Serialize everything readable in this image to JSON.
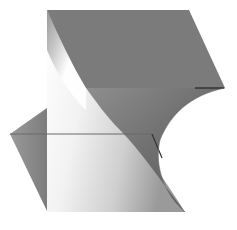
{
  "figure": {
    "background": "#ffffff",
    "colors": {
      "top_face": "#7b7b7b",
      "left_flap": "#8a8a8a",
      "lower_light": "#f4f4f4",
      "shadow_dark": "#5e5e5e",
      "edge_line": "#5a5a5a"
    }
  }
}
